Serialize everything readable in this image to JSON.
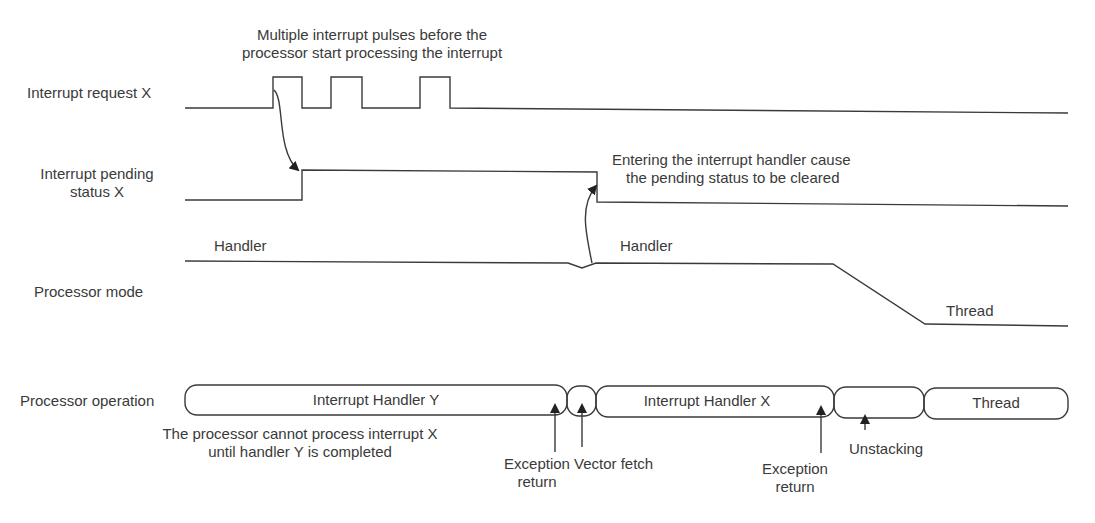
{
  "signals": {
    "request": "Interrupt request X",
    "pending_line1": "Interrupt pending",
    "pending_line2": "status X",
    "mode": "Processor mode",
    "operation": "Processor operation"
  },
  "annotations": {
    "pulses_line1": "Multiple interrupt pulses before the",
    "pulses_line2": "processor start processing the interrupt",
    "clear_line1": "Entering the interrupt handler cause",
    "clear_line2": "the pending status to be cleared",
    "cannot_line1": "The processor cannot process interrupt X",
    "cannot_line2": "until handler Y is completed"
  },
  "mode_labels": {
    "handler1": "Handler",
    "handler2": "Handler",
    "thread": "Thread"
  },
  "operation_boxes": [
    {
      "label": "Interrupt Handler Y"
    },
    {
      "label": ""
    },
    {
      "label": "Interrupt Handler X"
    },
    {
      "label": ""
    },
    {
      "label": "Thread"
    }
  ],
  "events": {
    "exc_return1_line1": "Exception",
    "exc_return1_line2": "return",
    "vector_fetch": "Vector fetch",
    "exc_return2_line1": "Exception",
    "exc_return2_line2": "return",
    "unstacking": "Unstacking"
  },
  "colors": {
    "stroke": "#3a3a3a",
    "text": "#3a3a3a",
    "background": "#ffffff"
  }
}
